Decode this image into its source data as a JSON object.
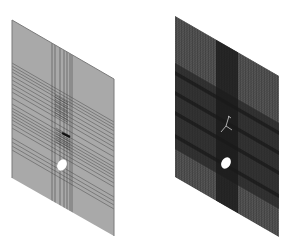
{
  "figure": {
    "panels": [
      {
        "id": "geometry-partition",
        "label": "Plate with partition lines",
        "fill": "#a9a9a9",
        "edge": "#7a7a7a",
        "line_color": "#4a4a4a",
        "feature": "circular-hole",
        "vertical_partition_lines": 7,
        "horizontal_partition_lines": 22
      },
      {
        "id": "meshed-model",
        "label": "Plate with dense FE mesh",
        "fill": "#6a6a6a",
        "mesh_color": "#2b2b2b",
        "dense_band_color": "#262626",
        "strip_color": "#1a1a1a",
        "feature": "circular-hole",
        "crack_marker": true
      }
    ],
    "hole_color": "#ffffff"
  }
}
